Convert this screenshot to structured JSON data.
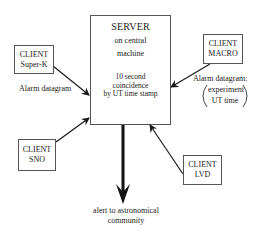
{
  "diagram": {
    "server": {
      "title": "SERVER",
      "line1": "on central",
      "line2": "machine",
      "coinc1": "10 second",
      "coinc2": "coincidence",
      "coinc3": "by UT time stamp"
    },
    "clients": [
      {
        "id": "super-k",
        "line1": "CLIENT",
        "line2": "Super-K"
      },
      {
        "id": "macro",
        "line1": "CLIENT",
        "line2": "MACRO"
      },
      {
        "id": "sno",
        "line1": "CLIENT",
        "line2": "SNO"
      },
      {
        "id": "lvd",
        "line1": "CLIENT",
        "line2": "LVD"
      }
    ],
    "labels": {
      "alarm_left": "Alarm datagram",
      "alarm_right": "Alarm datagram:",
      "alarm_right_paren1": "experiment",
      "alarm_right_paren2": "UT time"
    },
    "output": {
      "line1": "alert to astronomical",
      "line2": "community"
    },
    "colors": {
      "line": "#1a1a1a",
      "border": "#555555",
      "background": "#ffffff"
    }
  }
}
